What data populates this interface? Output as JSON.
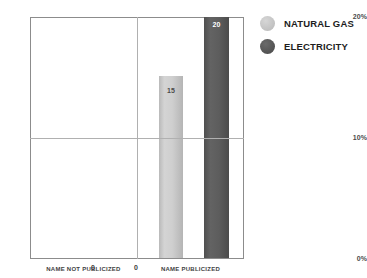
{
  "chart_data": {
    "type": "bar",
    "title": "",
    "subtitle": "",
    "xlabel": "",
    "ylabel": "",
    "categories": [
      "NAME NOT PUBLICIZED",
      "NAME PUBLICIZED"
    ],
    "series": [
      {
        "name": "NATURAL GAS",
        "values": [
          0,
          15
        ],
        "color": "#c9c9c9"
      },
      {
        "name": "ELECTRICITY",
        "values": [
          0,
          20
        ],
        "color": "#5a5a5a"
      }
    ],
    "value_labels": [
      [
        "0",
        "0"
      ],
      [
        "15",
        "20"
      ]
    ],
    "ylim": [
      0,
      20
    ],
    "yticks": [
      0,
      10,
      20
    ],
    "ytick_labels": [
      "0%",
      "10%",
      "20%"
    ],
    "grid": true,
    "grid_axis": "both",
    "legend_position": "right",
    "units": "percent"
  },
  "axis": {
    "y": {
      "tick_top": "20%",
      "tick_mid": "10%",
      "tick_bottom": "0%"
    },
    "x": {
      "category_left": "NAME NOT PUBLICIZED",
      "category_right": "NAME PUBLICIZED"
    }
  },
  "bars": {
    "not_publicized": {
      "natural_gas_label": "0",
      "electricity_label": "0"
    },
    "publicized": {
      "natural_gas_label": "15",
      "electricity_label": "20"
    }
  },
  "legend": {
    "items": [
      {
        "label": "NATURAL GAS",
        "swatch": "circle-light-gray"
      },
      {
        "label": "ELECTRICITY",
        "swatch": "circle-dark-gray"
      }
    ]
  },
  "colors": {
    "natural_gas": "#c9c9c9",
    "electricity": "#5a5a5a",
    "axis_line": "#8c8c8c",
    "gridline": "#b0b0b0",
    "text": "#3f3f3f",
    "background": "#ffffff"
  }
}
